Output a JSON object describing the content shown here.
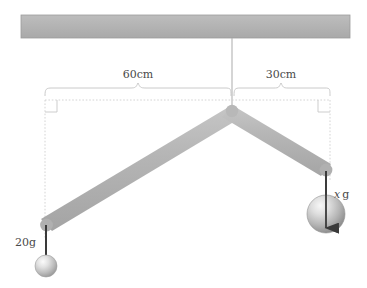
{
  "figure": {
    "background_color": "#ffffff"
  },
  "ceiling": {
    "name": "ceiling-bar",
    "fill_top": "#b6b6b6",
    "fill_bottom": "#a8a8a8",
    "stroke": "#9a9a9a"
  },
  "suspension": {
    "name": "suspension-wire",
    "color": "#b0b0b0"
  },
  "rod": {
    "name": "bent-rod",
    "fill": "#b3b3b3",
    "highlight": "#c9c9c9",
    "shadow": "#a2a2a2"
  },
  "dimensions": {
    "left": {
      "label": "60cm",
      "value": 60,
      "unit": "cm"
    },
    "right": {
      "label": "30cm",
      "value": 30,
      "unit": "cm"
    },
    "guide_color": "#cccccc",
    "brace_color": "#c0c0c0"
  },
  "masses": {
    "left": {
      "name": "left-mass",
      "label": "20g",
      "value": 20,
      "unit": "g",
      "sphere_fill_light": "#f0f0f0",
      "sphere_fill_dark": "#9a9a9a"
    },
    "right": {
      "name": "right-mass",
      "label_variable": "x",
      "label_unit": "g",
      "label": "x g",
      "sphere_fill_light": "#eeeeee",
      "sphere_fill_dark": "#8f8f8f"
    }
  },
  "strings": {
    "color": "#3a3a3a"
  }
}
